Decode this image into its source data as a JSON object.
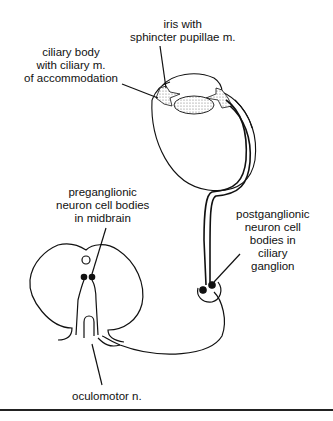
{
  "diagram": {
    "labels": {
      "iris": [
        "iris with",
        "sphincter pupillae m."
      ],
      "ciliary_body": [
        "ciliary body",
        "with ciliary m.",
        "of accommodation"
      ],
      "preganglionic": [
        "preganglionic",
        "neuron cell bodies",
        "in midbrain"
      ],
      "postganglionic": [
        "postganglionic",
        "neuron cell",
        "bodies in",
        "ciliary",
        "ganglion"
      ],
      "oculomotor": [
        "oculomotor n."
      ]
    },
    "colors": {
      "line": "#111111",
      "stipple": "#d9d9d9",
      "background": "#ffffff"
    }
  }
}
